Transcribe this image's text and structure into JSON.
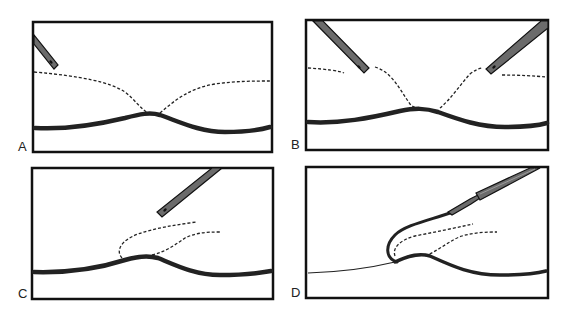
{
  "figure": {
    "panels": [
      {
        "id": "A",
        "label": "A",
        "description": "Single instrument tip at upper left; dashed plane lines converge at membrane apex"
      },
      {
        "id": "B",
        "label": "B",
        "description": "Two instrument tips from upper left and upper right; dashed lines separated and meeting at membrane apex"
      },
      {
        "id": "C",
        "label": "C",
        "description": "Single instrument from upper right; dashed flap lines lifted above membrane"
      },
      {
        "id": "D",
        "label": "D",
        "description": "Forceps-style instrument lifting membrane into a fold; dashed lines inside the fold"
      }
    ],
    "colors": {
      "frame": "#111111",
      "membrane": "#222222",
      "instrument": "#6b6b6b",
      "background": "#ffffff"
    }
  }
}
